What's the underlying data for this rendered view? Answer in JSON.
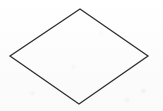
{
  "figure": {
    "kind": "geometric-shape-figure",
    "shape_name": "diamond",
    "shape_alt_name": "rhombus",
    "title": "",
    "caption": "",
    "labels": [],
    "background_color": "#fdfdfd",
    "stroke_color": "#2f2f2f",
    "stroke_width": 1.3,
    "fill_color": "none",
    "canvas": {
      "width": 163,
      "height": 111
    },
    "vertices": [
      {
        "name": "top",
        "x": 80,
        "y": 9
      },
      {
        "name": "right",
        "x": 148,
        "y": 56
      },
      {
        "name": "bottom",
        "x": 79,
        "y": 104
      },
      {
        "name": "left",
        "x": 10,
        "y": 56
      }
    ],
    "polygon_points": "80,9 148,56 79,104 10,56"
  }
}
